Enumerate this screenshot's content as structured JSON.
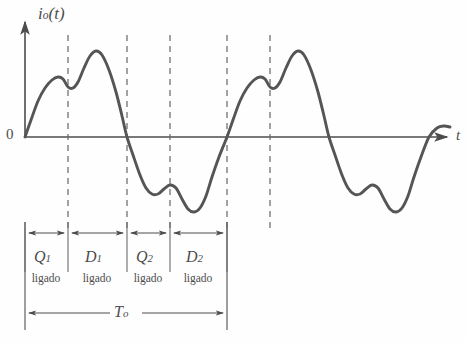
{
  "figure": {
    "type": "waveform-plot",
    "stroke_color": "#4c4c4c",
    "curve_color": "#555555",
    "background": "#ffffff"
  },
  "axes": {
    "y_label": "i",
    "y_label_sub": "o",
    "y_label_arg": "(t)",
    "x_label": "t",
    "origin_label": "0",
    "x_axis_y": 137,
    "y_axis_x": 25,
    "x_axis_end": 452,
    "y_axis_top": 18
  },
  "dashed_lines": [
    {
      "name": "d1",
      "x": 68
    },
    {
      "name": "d2",
      "x": 127
    },
    {
      "name": "d3",
      "x": 170
    },
    {
      "name": "d4",
      "x": 227
    },
    {
      "name": "d5",
      "x": 270
    }
  ],
  "intervals": [
    {
      "device": "Q",
      "sub": "1",
      "state": "ligado",
      "x_start": 25,
      "x_end": 68,
      "center": 46
    },
    {
      "device": "D",
      "sub": "1",
      "state": "ligado",
      "x_start": 68,
      "x_end": 127,
      "center": 97
    },
    {
      "device": "Q",
      "sub": "2",
      "state": "ligado",
      "x_start": 127,
      "x_end": 170,
      "center": 148
    },
    {
      "device": "D",
      "sub": "2",
      "state": "ligado",
      "x_start": 170,
      "x_end": 227,
      "center": 198
    }
  ],
  "period": {
    "label": "T",
    "sub": "o",
    "x_start": 25,
    "x_end": 227
  },
  "chart_data": {
    "type": "line",
    "title": "",
    "xlabel": "t",
    "ylabel": "i_o(t)",
    "grid": false,
    "legend": "none",
    "series": [
      {
        "name": "i_o(t)",
        "points_px": [
          [
            25,
            137
          ],
          [
            31,
            120
          ],
          [
            38,
            101
          ],
          [
            45,
            88
          ],
          [
            52,
            80
          ],
          [
            58,
            77
          ],
          [
            63,
            79
          ],
          [
            68,
            87
          ],
          [
            73,
            88
          ],
          [
            78,
            82
          ],
          [
            84,
            68
          ],
          [
            90,
            56
          ],
          [
            96,
            51
          ],
          [
            102,
            55
          ],
          [
            109,
            70
          ],
          [
            116,
            92
          ],
          [
            122,
            116
          ],
          [
            127,
            137
          ],
          [
            133,
            155
          ],
          [
            140,
            175
          ],
          [
            146,
            188
          ],
          [
            152,
            194
          ],
          [
            158,
            194
          ],
          [
            164,
            189
          ],
          [
            170,
            185
          ],
          [
            176,
            188
          ],
          [
            182,
            199
          ],
          [
            188,
            209
          ],
          [
            194,
            212
          ],
          [
            200,
            208
          ],
          [
            206,
            196
          ],
          [
            212,
            177
          ],
          [
            219,
            157
          ],
          [
            227,
            137
          ],
          [
            233,
            120
          ],
          [
            240,
            101
          ],
          [
            247,
            88
          ],
          [
            254,
            80
          ],
          [
            260,
            77
          ],
          [
            265,
            79
          ],
          [
            270,
            87
          ],
          [
            275,
            88
          ],
          [
            280,
            82
          ],
          [
            286,
            68
          ],
          [
            292,
            56
          ],
          [
            298,
            51
          ],
          [
            304,
            55
          ],
          [
            311,
            70
          ],
          [
            318,
            92
          ],
          [
            324,
            116
          ],
          [
            329,
            137
          ],
          [
            335,
            155
          ],
          [
            342,
            175
          ],
          [
            348,
            188
          ],
          [
            354,
            194
          ],
          [
            360,
            194
          ],
          [
            366,
            189
          ],
          [
            372,
            185
          ],
          [
            378,
            188
          ],
          [
            384,
            199
          ],
          [
            390,
            209
          ],
          [
            396,
            212
          ],
          [
            402,
            208
          ],
          [
            408,
            196
          ],
          [
            414,
            177
          ],
          [
            421,
            157
          ],
          [
            429,
            137
          ],
          [
            437,
            128
          ],
          [
            444,
            126
          ],
          [
            450,
            127
          ]
        ]
      }
    ]
  }
}
